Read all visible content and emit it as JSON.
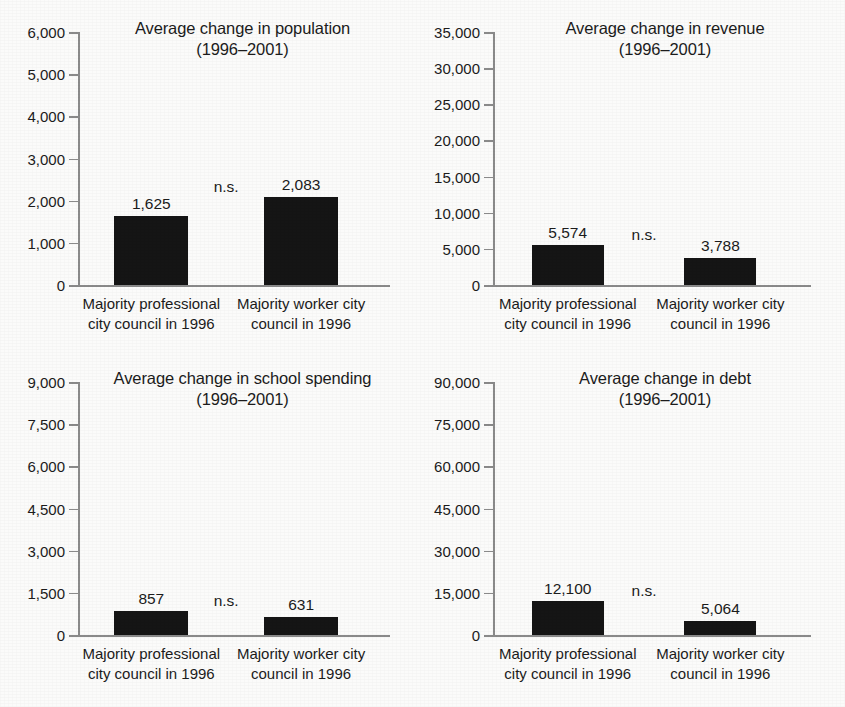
{
  "figure": {
    "background_color": "#fbfbfa",
    "bar_color": "#151515",
    "axis_color": "#8a8a8a",
    "text_color": "#1c1c1c",
    "layout": "2x2 grid of bar charts"
  },
  "chart_data": [
    {
      "type": "bar",
      "panel": "top-left",
      "title": "Average change in population",
      "subtitle": "(1996–2001)",
      "categories": [
        "Majority professional city council in 1996",
        "Majority worker city council in 1996"
      ],
      "category_lines": [
        [
          "Majority professional",
          "city council in 1996"
        ],
        [
          "Majority worker city",
          "council in 1996"
        ]
      ],
      "values": [
        1625,
        2083
      ],
      "value_labels": [
        "1,625",
        "2,083"
      ],
      "annotation": "n.s.",
      "xlabel": "",
      "ylabel": "",
      "ylim": [
        0,
        6000
      ],
      "ytick_step": 1000,
      "yticks": [
        0,
        1000,
        2000,
        3000,
        4000,
        5000,
        6000
      ],
      "ytick_labels": [
        "0",
        "1,000",
        "2,000",
        "3,000",
        "4,000",
        "5,000",
        "6,000"
      ],
      "grid": false,
      "legend": "none"
    },
    {
      "type": "bar",
      "panel": "top-right",
      "title": "Average change in revenue",
      "subtitle": "(1996–2001)",
      "categories": [
        "Majority professional city council in 1996",
        "Majority worker city council in 1996"
      ],
      "category_lines": [
        [
          "Majority professional",
          "city council in 1996"
        ],
        [
          "Majority worker city",
          "council in 1996"
        ]
      ],
      "values": [
        5574,
        3788
      ],
      "value_labels": [
        "5,574",
        "3,788"
      ],
      "annotation": "n.s.",
      "xlabel": "",
      "ylabel": "",
      "ylim": [
        0,
        35000
      ],
      "ytick_step": 5000,
      "yticks": [
        0,
        5000,
        10000,
        15000,
        20000,
        25000,
        30000,
        35000
      ],
      "ytick_labels": [
        "0",
        "5,000",
        "10,000",
        "15,000",
        "20,000",
        "25,000",
        "30,000",
        "35,000"
      ],
      "grid": false,
      "legend": "none"
    },
    {
      "type": "bar",
      "panel": "bottom-left",
      "title": "Average change in school spending",
      "subtitle": "(1996–2001)",
      "categories": [
        "Majority professional city council in 1996",
        "Majority worker city council in 1996"
      ],
      "category_lines": [
        [
          "Majority professional",
          "city council in 1996"
        ],
        [
          "Majority worker city",
          "council in 1996"
        ]
      ],
      "values": [
        857,
        631
      ],
      "value_labels": [
        "857",
        "631"
      ],
      "annotation": "n.s.",
      "xlabel": "",
      "ylabel": "",
      "ylim": [
        0,
        9000
      ],
      "ytick_step": 1500,
      "yticks": [
        0,
        1500,
        3000,
        4500,
        6000,
        7500,
        9000
      ],
      "ytick_labels": [
        "0",
        "1,500",
        "3,000",
        "4,500",
        "6,000",
        "7,500",
        "9,000"
      ],
      "grid": false,
      "legend": "none"
    },
    {
      "type": "bar",
      "panel": "bottom-right",
      "title": "Average change in debt",
      "subtitle": "(1996–2001)",
      "categories": [
        "Majority professional city council in 1996",
        "Majority worker city council in 1996"
      ],
      "category_lines": [
        [
          "Majority professional",
          "city council in 1996"
        ],
        [
          "Majority worker city",
          "council in 1996"
        ]
      ],
      "values": [
        12100,
        5064
      ],
      "value_labels": [
        "12,100",
        "5,064"
      ],
      "annotation": "n.s.",
      "xlabel": "",
      "ylabel": "",
      "ylim": [
        0,
        90000
      ],
      "ytick_step": 15000,
      "yticks": [
        0,
        15000,
        30000,
        45000,
        60000,
        75000,
        90000
      ],
      "ytick_labels": [
        "0",
        "15,000",
        "30,000",
        "45,000",
        "60,000",
        "75,000",
        "90,000"
      ],
      "grid": false,
      "legend": "none"
    }
  ]
}
